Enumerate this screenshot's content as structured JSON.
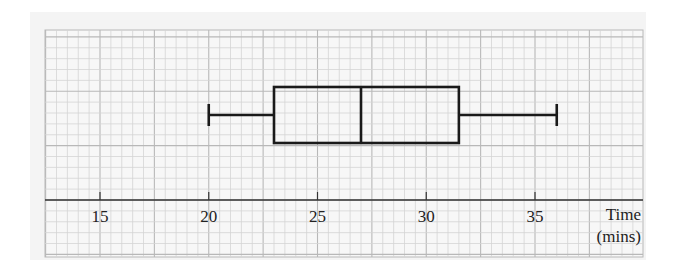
{
  "chart_data": {
    "type": "boxplot",
    "title": "",
    "xlabel": "Time (mins)",
    "xlabel_lines": [
      "Time",
      "(mins)"
    ],
    "ylabel": "",
    "xlim": [
      12.5,
      40
    ],
    "x_ticks": [
      15,
      20,
      25,
      30,
      35
    ],
    "x_tick_labels": [
      "15",
      "20",
      "25",
      "30",
      "35"
    ],
    "grid": true,
    "grid_minor_step": 0.5,
    "grid_major_step": 2.5,
    "boxplot": {
      "min": 20,
      "q1": 23,
      "median": 27,
      "q3": 31.5,
      "max": 36
    }
  },
  "colors": {
    "background": "#f4f4f4",
    "grid_minor": "#d4d4d4",
    "grid_major": "#b8b8b8",
    "ink": "#1a1a1a"
  }
}
